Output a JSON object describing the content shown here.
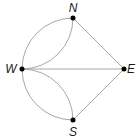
{
  "diagram": {
    "type": "multigraph",
    "nodes": [
      {
        "id": "N",
        "label": "N",
        "x": 73,
        "y": 18,
        "lx": 73,
        "ly": 12
      },
      {
        "id": "W",
        "label": "W",
        "x": 22,
        "y": 69,
        "lx": 11,
        "ly": 73
      },
      {
        "id": "E",
        "label": "E",
        "x": 124,
        "y": 69,
        "lx": 131,
        "ly": 73
      },
      {
        "id": "S",
        "label": "S",
        "x": 73,
        "y": 120,
        "lx": 73,
        "ly": 136
      }
    ],
    "edges": [
      {
        "from": "N",
        "to": "W",
        "style": "outer-arc"
      },
      {
        "from": "N",
        "to": "W",
        "style": "inner-arc"
      },
      {
        "from": "W",
        "to": "S",
        "style": "outer-arc"
      },
      {
        "from": "W",
        "to": "S",
        "style": "inner-arc"
      },
      {
        "from": "W",
        "to": "E",
        "style": "straight"
      },
      {
        "from": "N",
        "to": "E",
        "style": "straight"
      },
      {
        "from": "S",
        "to": "E",
        "style": "straight"
      }
    ],
    "colors": {
      "edge": "#a8a8a8",
      "node": "#000000",
      "label": "#1a1a1a"
    }
  }
}
